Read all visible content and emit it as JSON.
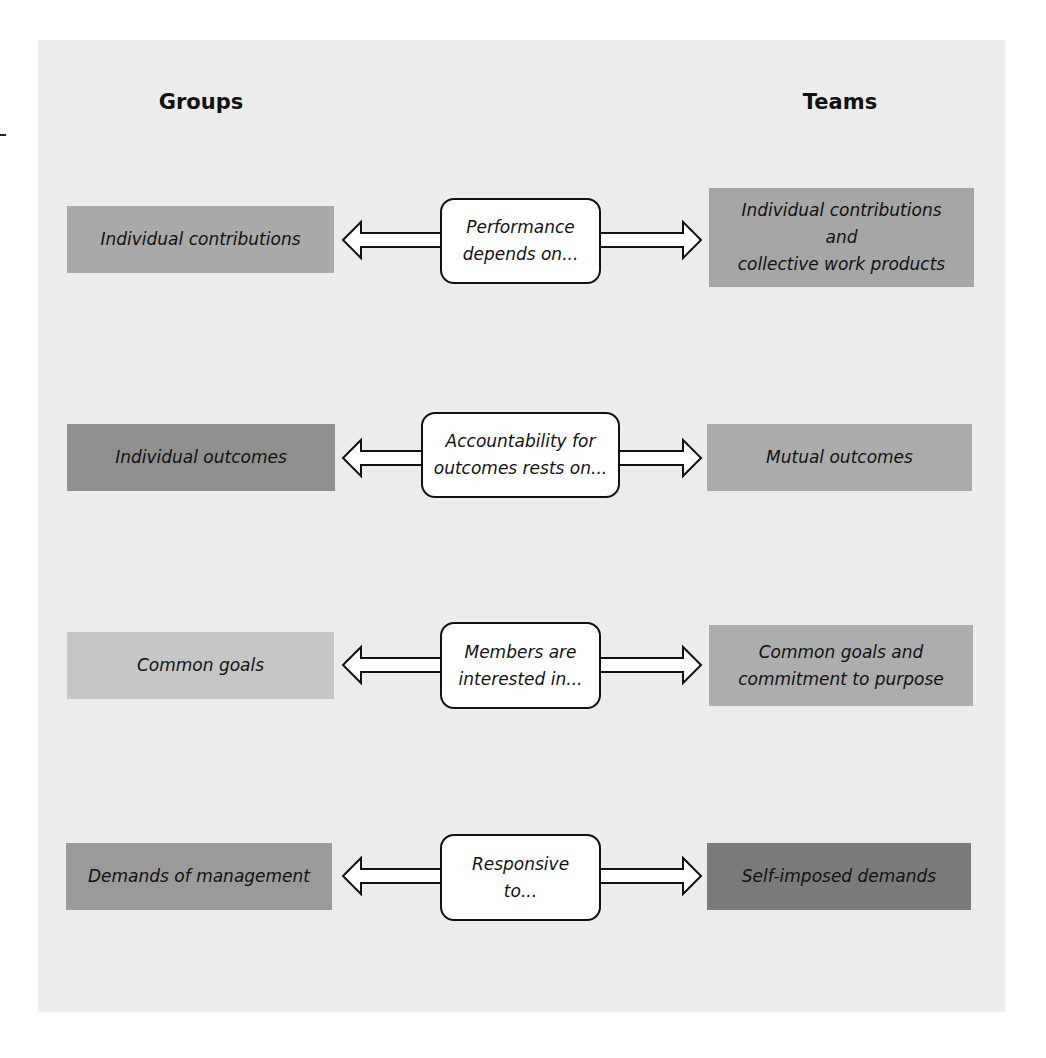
{
  "headers": {
    "left": "Groups",
    "right": "Teams"
  },
  "rows": [
    {
      "left": "Individual contributions",
      "center": "Performance\ndepends on...",
      "right": "Individual contributions\nand\ncollective work products",
      "left_color": "#a9a9a9",
      "right_color": "#a6a6a6"
    },
    {
      "left": "Individual outcomes",
      "center": "Accountability for\noutcomes rests on...",
      "right": "Mutual outcomes",
      "left_color": "#8f8f8f",
      "right_color": "#ababab"
    },
    {
      "left": "Common goals",
      "center": "Members are\ninterested in...",
      "right": "Common goals and\ncommitment to purpose",
      "left_color": "#c6c6c6",
      "right_color": "#adadad"
    },
    {
      "left": "Demands of management",
      "center": "Responsive\nto...",
      "right": "Self-imposed demands",
      "left_color": "#9a9a9a",
      "right_color": "#7a7a7a"
    }
  ],
  "colors": {
    "panel": "#ececec",
    "callout_fill": "#ffffff",
    "stroke": "#111111"
  }
}
